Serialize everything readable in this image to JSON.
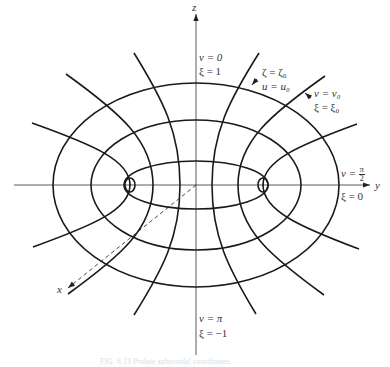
{
  "figure": {
    "stroke_color": "#1a1a1a",
    "axis_color": "#333333",
    "center": [
      196,
      185
    ],
    "foci": [
      [
        130,
        185
      ],
      [
        263,
        185
      ]
    ]
  },
  "axes": {
    "z": {
      "label": "z",
      "from": [
        196,
        355
      ],
      "to": [
        196,
        14
      ],
      "label_pos": [
        192,
        2
      ]
    },
    "y": {
      "label": "y",
      "from": [
        14,
        185
      ],
      "to": [
        370,
        185
      ],
      "label_pos": [
        375,
        179
      ]
    },
    "x": {
      "label": "x",
      "from": [
        196,
        185
      ],
      "to": [
        68,
        288
      ],
      "label_pos": [
        56,
        285
      ],
      "dashed": true
    }
  },
  "ellipses": [
    {
      "name": "outer-ellipse",
      "cx": 196,
      "cy": 185,
      "rx": 143,
      "ry": 102
    },
    {
      "name": "middle-ellipse",
      "cx": 196,
      "cy": 185,
      "rx": 105,
      "ry": 65
    },
    {
      "name": "inner-ellipse",
      "cx": 196,
      "cy": 185,
      "rx": 72,
      "ry": 24
    }
  ],
  "hyperbolas": [
    {
      "name": "hyperbola-left-inner",
      "top": [
        134,
        53
      ],
      "vertex": [
        180,
        185
      ],
      "bottom": [
        134,
        315
      ]
    },
    {
      "name": "hyperbola-left-middle",
      "top": [
        66,
        74
      ],
      "vertex": [
        153,
        185
      ],
      "bottom": [
        68,
        294
      ]
    },
    {
      "name": "hyperbola-left-outer",
      "top": [
        32,
        123
      ],
      "vertex": [
        130,
        185
      ],
      "bottom": [
        33,
        247
      ]
    },
    {
      "name": "hyperbola-right-inner",
      "top": [
        259,
        53
      ],
      "vertex": [
        212,
        185
      ],
      "bottom": [
        256,
        314
      ]
    },
    {
      "name": "hyperbola-right-middle",
      "top": [
        325,
        76
      ],
      "vertex": [
        238,
        185
      ],
      "bottom": [
        324,
        295
      ]
    },
    {
      "name": "hyperbola-right-outer",
      "top": [
        357,
        124
      ],
      "vertex": [
        263,
        185
      ],
      "bottom": [
        359,
        249
      ]
    }
  ],
  "focus_loops": [
    {
      "name": "focus-loop-left",
      "cx": 130,
      "cy": 185,
      "rx": 5,
      "ry": 7
    },
    {
      "name": "focus-loop-right",
      "cx": 263,
      "cy": 185,
      "rx": 5,
      "ry": 7
    }
  ],
  "pointers": [
    {
      "name": "pointer-u0",
      "from": [
        257,
        79
      ],
      "to": [
        252,
        85
      ]
    },
    {
      "name": "pointer-v0",
      "from": [
        311,
        98
      ],
      "to": [
        305,
        93
      ]
    }
  ],
  "labels": {
    "top_v": "v = 0",
    "top_xi": "ξ = 1",
    "zeta": "ζ = ζ₀",
    "u": "u = u₀",
    "v0": "v = v₀",
    "xi0": "ξ = ξ₀",
    "v_half_pre": "v = ",
    "v_half_num": "π",
    "v_half_den": "2",
    "xi_zero": "ξ = 0",
    "bottom_v": "v = π",
    "bottom_xi": "ξ = −1"
  },
  "caption": {
    "text": "FIG. 6.13  Prolate spheroidal coordinates."
  }
}
